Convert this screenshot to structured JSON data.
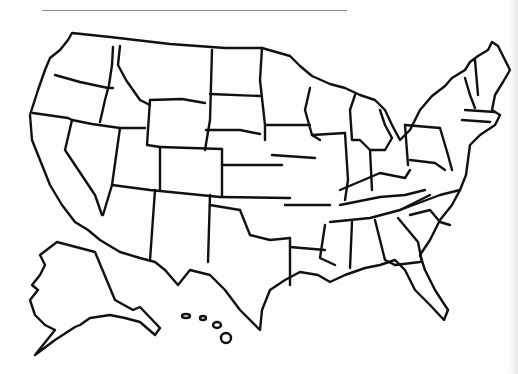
{
  "map": {
    "type": "blank-outline-map",
    "subject": "United States",
    "includes_insets": [
      "Alaska",
      "Hawaii"
    ],
    "labels": [],
    "line_color": "#111111",
    "background_color": "#fdfdfd",
    "header_line": {
      "visible": true,
      "color": "#8a8a8a"
    }
  }
}
